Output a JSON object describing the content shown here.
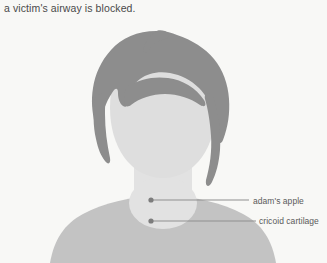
{
  "caption": {
    "text": "a victim's airway is blocked."
  },
  "illustration": {
    "title": "victim head and neck silhouette",
    "subject": "human head, neck and shoulders shown from the front",
    "colors": {
      "background": "#f8f8f6",
      "hair": "#8d8d8d",
      "face": "#dedede",
      "neck": "#e2e2e2",
      "torso": "#c3c3c3",
      "leader_line": "#8f8f8f",
      "leader_dot": "#7d7d7d",
      "caption_text": "#4a4a4a",
      "label_text": "#5a5a5a"
    }
  },
  "callouts": [
    {
      "id": "adams-apple",
      "label": "adam's apple",
      "dot": {
        "x": 151,
        "y": 200
      },
      "line_end_x": 249,
      "label_x": 253,
      "label_y": 196
    },
    {
      "id": "cricoid-cartilage",
      "label": "cricoid cartilage",
      "dot": {
        "x": 151,
        "y": 221
      },
      "line_end_x": 256,
      "label_x": 259,
      "label_y": 216
    }
  ]
}
